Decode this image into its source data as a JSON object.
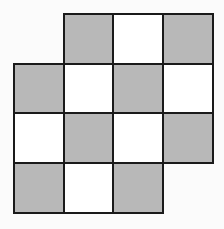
{
  "diagram": {
    "type": "checkered-grid-polyomino",
    "rows": 4,
    "cols": 4,
    "origin": [
      13,
      13
    ],
    "cell_size": 51,
    "colors": {
      "gray": "#b8b8b8",
      "white": "#ffffff",
      "border": "#1a1a1a",
      "background": "#fbfbfb"
    },
    "cells": [
      {
        "row": 0,
        "col": 1,
        "fill": "gray"
      },
      {
        "row": 0,
        "col": 2,
        "fill": "white"
      },
      {
        "row": 0,
        "col": 3,
        "fill": "gray"
      },
      {
        "row": 1,
        "col": 0,
        "fill": "gray"
      },
      {
        "row": 1,
        "col": 1,
        "fill": "white"
      },
      {
        "row": 1,
        "col": 2,
        "fill": "gray"
      },
      {
        "row": 1,
        "col": 3,
        "fill": "white"
      },
      {
        "row": 2,
        "col": 0,
        "fill": "white"
      },
      {
        "row": 2,
        "col": 1,
        "fill": "gray"
      },
      {
        "row": 2,
        "col": 2,
        "fill": "white"
      },
      {
        "row": 2,
        "col": 3,
        "fill": "gray"
      },
      {
        "row": 3,
        "col": 0,
        "fill": "gray"
      },
      {
        "row": 3,
        "col": 1,
        "fill": "white"
      },
      {
        "row": 3,
        "col": 2,
        "fill": "gray"
      }
    ]
  }
}
